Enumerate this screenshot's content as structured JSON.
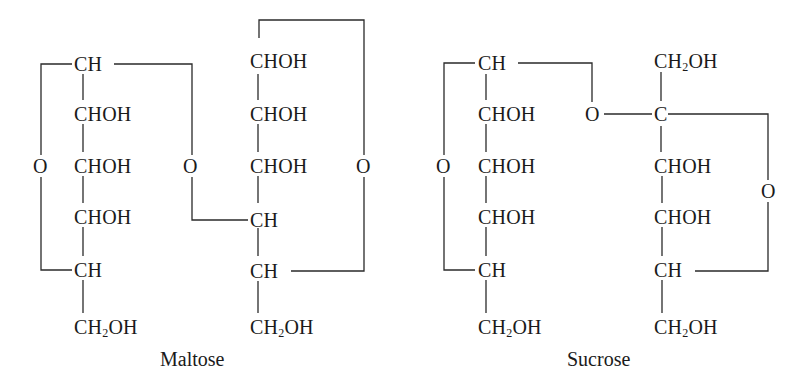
{
  "figure": {
    "structures": [
      {
        "name": "Maltose",
        "caption": "Maltose",
        "left_ring": {
          "chain": [
            "CH",
            "CHOH",
            "CHOH",
            "CHOH",
            "CH",
            "CH₂OH"
          ],
          "ring_oxygen": "O"
        },
        "bridge_oxygen": "O",
        "right_ring": {
          "chain": [
            "CHOH",
            "CHOH",
            "CHOH",
            "CH",
            "CH",
            "CH₂OH"
          ],
          "ring_oxygen": "O"
        }
      },
      {
        "name": "Sucrose",
        "caption": "Sucrose",
        "left_ring": {
          "chain": [
            "CH",
            "CHOH",
            "CHOH",
            "CHOH",
            "CH",
            "CH₂OH"
          ],
          "ring_oxygen": "O"
        },
        "bridge_oxygen": "O",
        "right_ring": {
          "chain": [
            "CH₂OH",
            "C",
            "CHOH",
            "CHOH",
            "CH",
            "CH₂OH"
          ],
          "ring_oxygen": "O"
        }
      }
    ],
    "colors": {
      "ink": "#1a1a1a",
      "background": "#ffffff"
    }
  }
}
